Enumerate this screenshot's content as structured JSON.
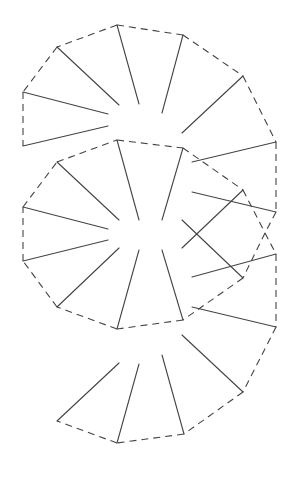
{
  "diagram": {
    "title": "",
    "stroke_color": "#444444",
    "background": "#ffffff",
    "groups": [
      {
        "name": "top-fan",
        "dashed": [
          [
            117,
            25,
            183,
            35
          ],
          [
            183,
            35,
            243,
            76
          ],
          [
            243,
            76,
            276,
            142
          ],
          [
            117,
            25,
            57,
            47
          ],
          [
            57,
            47,
            23,
            92
          ],
          [
            23,
            92,
            23,
            146
          ]
        ],
        "solid": [
          [
            57,
            47,
            119,
            105
          ],
          [
            23,
            92,
            108,
            114
          ],
          [
            23,
            146,
            108,
            126
          ],
          [
            117,
            25,
            139,
            104
          ],
          [
            183,
            35,
            162,
            113
          ],
          [
            243,
            76,
            182,
            133
          ],
          [
            276,
            142,
            192,
            162
          ]
        ]
      },
      {
        "name": "middle-octagon",
        "dashed": [
          [
            117,
            140,
            183,
            148
          ],
          [
            183,
            148,
            243,
            190
          ],
          [
            243,
            190,
            265,
            233
          ],
          [
            265,
            233,
            243,
            278
          ],
          [
            243,
            278,
            183,
            320
          ],
          [
            183,
            320,
            117,
            329
          ],
          [
            117,
            329,
            57,
            307
          ],
          [
            57,
            307,
            23,
            261
          ],
          [
            23,
            261,
            23,
            207
          ],
          [
            23,
            207,
            57,
            162
          ],
          [
            57,
            162,
            117,
            140
          ]
        ],
        "solid": [
          [
            57,
            162,
            119,
            220
          ],
          [
            23,
            207,
            108,
            229
          ],
          [
            23,
            261,
            108,
            240
          ],
          [
            57,
            307,
            119,
            248
          ],
          [
            117,
            140,
            139,
            220
          ],
          [
            117,
            329,
            139,
            250
          ],
          [
            183,
            148,
            162,
            220
          ],
          [
            243,
            190,
            182,
            248
          ],
          [
            182,
            220,
            243,
            278
          ],
          [
            183,
            320,
            162,
            250
          ]
        ]
      },
      {
        "name": "right-fan",
        "dashed": [
          [
            276,
            142,
            276,
            212
          ],
          [
            276,
            212,
            265,
            233
          ],
          [
            265,
            233,
            276,
            254
          ],
          [
            276,
            254,
            276,
            327
          ]
        ],
        "solid": [
          [
            192,
            192,
            276,
            212
          ],
          [
            192,
            277,
            276,
            254
          ],
          [
            192,
            307,
            276,
            327
          ]
        ]
      },
      {
        "name": "bottom-fan",
        "dashed": [
          [
            276,
            327,
            243,
            392
          ],
          [
            243,
            392,
            184,
            434
          ],
          [
            184,
            434,
            117,
            443
          ],
          [
            117,
            443,
            57,
            421
          ]
        ],
        "solid": [
          [
            119,
            363,
            57,
            421
          ],
          [
            139,
            364,
            117,
            443
          ],
          [
            162,
            355,
            184,
            434
          ],
          [
            182,
            335,
            243,
            392
          ]
        ]
      }
    ]
  }
}
